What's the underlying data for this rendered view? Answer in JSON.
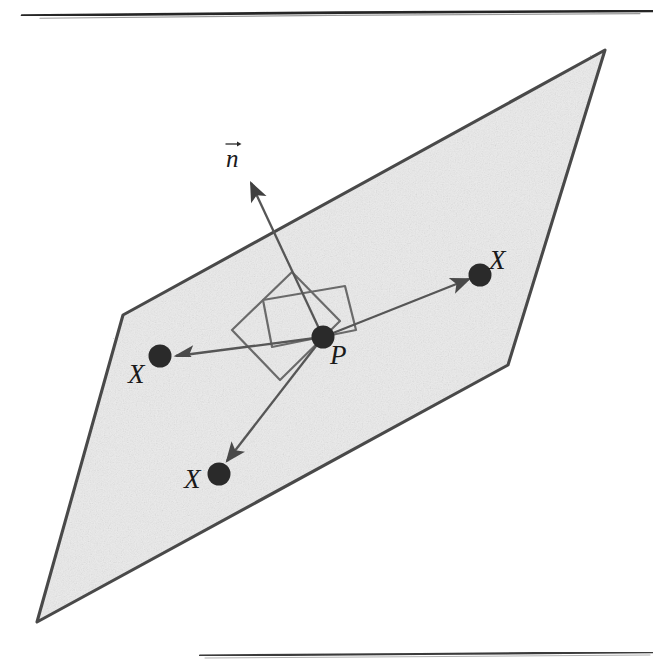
{
  "figure": {
    "caption_text": "",
    "background_color": "#ffffff",
    "plane": {
      "name": "tangent-plane",
      "fill_color": "#ebebeb",
      "stroke_color": "#4a4a4a",
      "vertices": [
        [
          605,
          50
        ],
        [
          508,
          365
        ],
        [
          37,
          622
        ],
        [
          123,
          315
        ]
      ]
    },
    "rules": {
      "top": {
        "y": 13,
        "x1": 22,
        "x2": 653,
        "color": "#252525"
      },
      "bottom": {
        "y": 653,
        "x1": 200,
        "x2": 653,
        "color": "#3a3a3a"
      }
    },
    "points": [
      {
        "id": "P",
        "label": "P",
        "cx": 323,
        "cy": 337,
        "r": 11.5,
        "label_x": 330,
        "label_y": 343
      },
      {
        "id": "X-right",
        "label": "X",
        "cx": 480,
        "cy": 275,
        "r": 11.5,
        "label_x": 489,
        "label_y": 248
      },
      {
        "id": "X-left",
        "label": "X",
        "cx": 160,
        "cy": 356,
        "r": 11.5,
        "label_x": 129,
        "label_y": 362
      },
      {
        "id": "X-bottom",
        "label": "X",
        "cx": 219,
        "cy": 474,
        "r": 11.5,
        "label_x": 185,
        "label_y": 468
      }
    ],
    "normal_vector": {
      "id": "n",
      "label": "n",
      "from": [
        323,
        337
      ],
      "to": [
        250,
        181
      ],
      "label_x": 228,
      "label_y": 146,
      "has_overarrow": true
    },
    "tangent_arrows": [
      {
        "id": "arrow-P-to-X-right",
        "from": [
          323,
          337
        ],
        "to": [
          471,
          278
        ]
      },
      {
        "id": "arrow-P-to-X-left",
        "from": [
          323,
          337
        ],
        "to": [
          174,
          356
        ]
      },
      {
        "id": "arrow-P-to-X-bottom",
        "from": [
          323,
          337
        ],
        "to": [
          226,
          462
        ]
      }
    ],
    "patch_quads": [
      {
        "id": "patch-quad-a",
        "points": [
          [
            263,
            300
          ],
          [
            345,
            286
          ],
          [
            356,
            330
          ],
          [
            272,
            347
          ]
        ]
      },
      {
        "id": "patch-quad-b",
        "points": [
          [
            292,
            272
          ],
          [
            340,
            321
          ],
          [
            280,
            380
          ],
          [
            232,
            330
          ]
        ]
      }
    ],
    "stroke_colors": {
      "plane_outline": "#4a4a4a",
      "arrow": "#565656",
      "patch": "#6b6b6b",
      "dot": "#2a2a2a"
    }
  }
}
